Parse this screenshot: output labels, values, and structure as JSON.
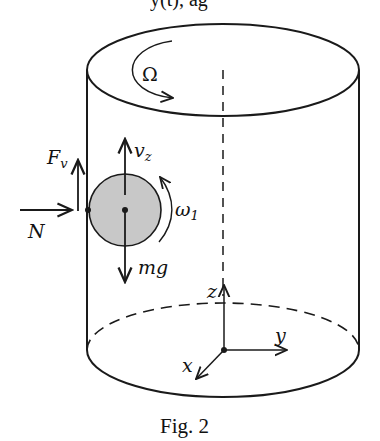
{
  "figure": {
    "caption": "Fig. 2",
    "top_cut_text": "y(t), ag",
    "colors": {
      "stroke": "#1a1a1a",
      "ball_fill": "#c8c8c8",
      "background": "#ffffff"
    },
    "cylinder": {
      "rotation_label": "Ω",
      "axis": "dashed vertical axis"
    },
    "ball": {
      "labels": {
        "velocity": "v",
        "velocity_sub": "z",
        "weight": "mg",
        "spin": "ω",
        "spin_sub": "1"
      }
    },
    "forces": {
      "normal": "N",
      "friction": "F",
      "friction_sub": "v"
    },
    "axes": {
      "x": "x",
      "y": "y",
      "z": "z"
    }
  }
}
